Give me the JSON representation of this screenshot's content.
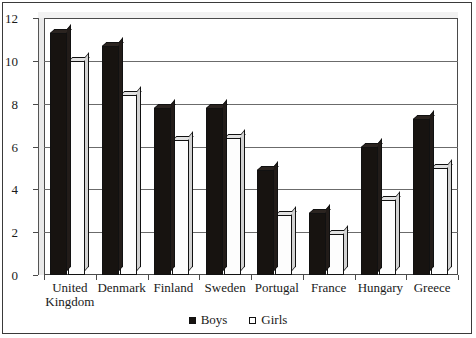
{
  "chart_data": {
    "type": "bar",
    "title": "",
    "subtitle": "",
    "xlabel": "",
    "ylabel": "",
    "categories": [
      "United\nKingdom",
      "Denmark",
      "Finland",
      "Sweden",
      "Portugal",
      "France",
      "Hungary",
      "Greece"
    ],
    "series": [
      {
        "name": "Boys",
        "color": "#171310",
        "values": [
          11.3,
          10.7,
          7.8,
          7.8,
          4.9,
          2.9,
          6.0,
          7.3
        ]
      },
      {
        "name": "Girls",
        "color": "#ffffff",
        "values": [
          10.0,
          8.4,
          6.3,
          6.4,
          2.8,
          1.9,
          3.5,
          5.0
        ]
      }
    ],
    "ylim": [
      0,
      12
    ],
    "yticks": [
      0,
      2,
      4,
      6,
      8,
      10,
      12
    ],
    "ytick_labels": [
      "0",
      "2",
      "4",
      "6",
      "8",
      "10",
      "12"
    ],
    "grid": true,
    "grid_axis": "y",
    "legend_position": "bottom",
    "style": "3d-bar"
  },
  "legend": {
    "entries": [
      {
        "label": "Boys",
        "marker": "filled-square-icon"
      },
      {
        "label": "Girls",
        "marker": "empty-square-icon"
      }
    ]
  }
}
